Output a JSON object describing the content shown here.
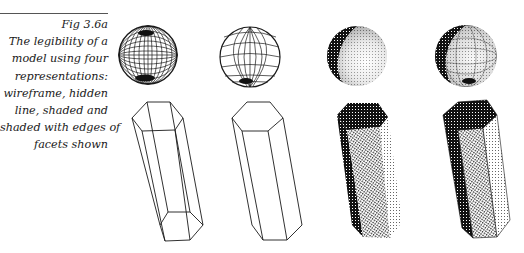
{
  "caption": {
    "figure_number": "Fig 3.6a",
    "lines": [
      "The legibility of a",
      "model using four",
      "representations:",
      "wireframe, hidden",
      "line, shaded and",
      "shaded with edges of",
      "facets shown"
    ]
  },
  "figure": {
    "representations": [
      {
        "name": "wireframe",
        "sphere": {
          "cx": 148,
          "cy": 55,
          "r": 29
        }
      },
      {
        "name": "hidden line",
        "sphere": {
          "cx": 250,
          "cy": 57,
          "r": 30
        }
      },
      {
        "name": "shaded",
        "sphere": {
          "cx": 357,
          "cy": 56,
          "r": 30
        }
      },
      {
        "name": "shaded with edges of facets shown",
        "sphere": {
          "cx": 466,
          "cy": 56,
          "r": 31
        }
      }
    ],
    "colors": {
      "ink": "#1a1a1a",
      "rule": "#555555",
      "background": "#ffffff"
    }
  }
}
